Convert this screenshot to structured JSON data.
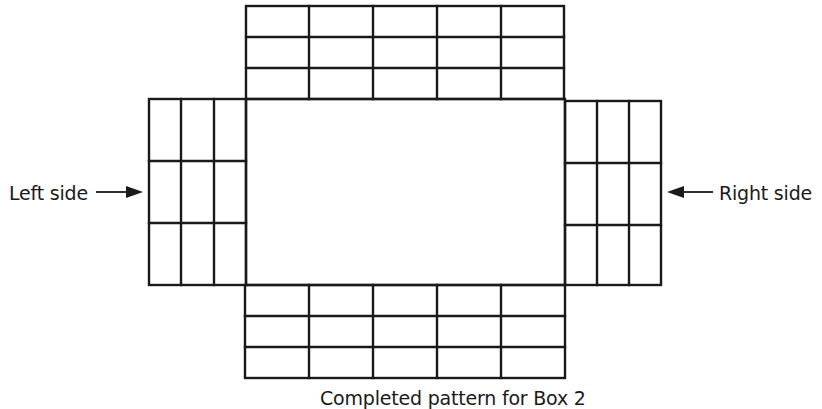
{
  "diagram": {
    "type": "box-net-pattern",
    "labels": {
      "left": "Left side",
      "right": "Right side",
      "caption": "Completed pattern for Box 2"
    },
    "colors": {
      "line": "#1a1a1a",
      "background": "#ffffff"
    },
    "blocks": {
      "top": {
        "rows": 3,
        "cols": 5
      },
      "bottom": {
        "rows": 3,
        "cols": 5
      },
      "left": {
        "rows": 3,
        "cols": 3
      },
      "right": {
        "rows": 3,
        "cols": 3
      },
      "center": {
        "rows": 1,
        "cols": 1
      }
    }
  }
}
